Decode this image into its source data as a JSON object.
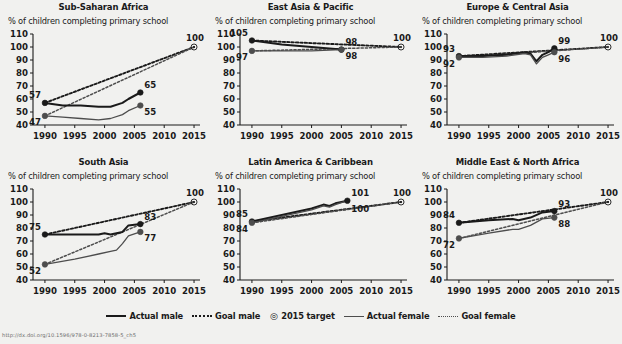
{
  "figure": {
    "subtitle_text": "% of children completing primary school",
    "footer": "http://dx.doi.org/10.1596/978-0-8213-7858-5_ch5"
  },
  "axis": {
    "y_ticks": [
      40,
      50,
      60,
      70,
      80,
      90,
      100,
      110
    ],
    "x_ticks": [
      1990,
      1995,
      2000,
      2005,
      2010,
      2015
    ],
    "ylim": [
      40,
      110
    ],
    "xlim": [
      1988,
      2016
    ],
    "grid": false
  },
  "legend": {
    "position": "bottom-center",
    "items": [
      {
        "label": "Actual male",
        "marker": "solid-line-thick"
      },
      {
        "label": "Goal male",
        "marker": "dotted-line-thick"
      },
      {
        "label": "2015 target",
        "marker": "circle-dot-target"
      },
      {
        "label": "Actual female",
        "marker": "solid-line-thin"
      },
      {
        "label": "Goal female",
        "marker": "dotted-line-thin"
      }
    ]
  },
  "colors": {
    "background": "#f1f1ef",
    "male": "#1a1a1a",
    "female": "#4d4d4d",
    "axis": "#1a1a1a",
    "text": "#1a1a1a"
  },
  "chart_data": [
    {
      "type": "line",
      "title": "Sub-Saharan Africa",
      "xlabel": "",
      "ylabel": "% of children completing primary school",
      "ylim": [
        40,
        110
      ],
      "xlim": [
        1988,
        2016
      ],
      "target": {
        "year": 2015,
        "value": 100,
        "label": "100"
      },
      "series": [
        {
          "name": "Actual male",
          "style": "solid-thick",
          "x": [
            1990,
            1993,
            1996,
            1999,
            2001,
            2003,
            2004,
            2006
          ],
          "values": [
            57,
            55,
            55,
            54,
            54,
            57,
            60,
            65
          ],
          "endpoints": [
            {
              "year": 1990,
              "value": 57,
              "label": "57"
            },
            {
              "year": 2006,
              "value": 65,
              "label": "65"
            }
          ]
        },
        {
          "name": "Actual female",
          "style": "solid-thin",
          "x": [
            1990,
            1993,
            1996,
            1999,
            2001,
            2003,
            2004,
            2006
          ],
          "values": [
            47,
            46,
            45,
            44,
            45,
            48,
            51,
            55
          ],
          "endpoints": [
            {
              "year": 1990,
              "value": 47,
              "label": "47"
            },
            {
              "year": 2006,
              "value": 55,
              "label": "55"
            }
          ]
        },
        {
          "name": "Goal male",
          "style": "dotted-thick",
          "x": [
            1990,
            2015
          ],
          "values": [
            57,
            100
          ]
        },
        {
          "name": "Goal female",
          "style": "dotted-thin",
          "x": [
            1990,
            2015
          ],
          "values": [
            47,
            100
          ]
        }
      ]
    },
    {
      "type": "line",
      "title": "East Asia & Pacific",
      "xlabel": "",
      "ylabel": "% of children completing primary school",
      "ylim": [
        40,
        110
      ],
      "xlim": [
        1988,
        2016
      ],
      "target": {
        "year": 2015,
        "value": 100,
        "label": "100"
      },
      "series": [
        {
          "name": "Actual male",
          "style": "solid-thick",
          "x": [
            1990,
            1995,
            2000,
            2005
          ],
          "values": [
            105,
            102,
            100,
            98
          ],
          "endpoints": [
            {
              "year": 1990,
              "value": 105,
              "label": "105"
            },
            {
              "year": 2005,
              "value": 98,
              "label": "98"
            }
          ]
        },
        {
          "name": "Actual female",
          "style": "solid-thin",
          "x": [
            1990,
            1995,
            2000,
            2005
          ],
          "values": [
            97,
            97,
            97,
            98
          ],
          "endpoints": [
            {
              "year": 1990,
              "value": 97,
              "label": "97"
            },
            {
              "year": 2005,
              "value": 98,
              "label": "98"
            }
          ]
        },
        {
          "name": "Goal male",
          "style": "dotted-thick",
          "x": [
            1990,
            2015
          ],
          "values": [
            105,
            100
          ]
        },
        {
          "name": "Goal female",
          "style": "dotted-thin",
          "x": [
            1990,
            2015
          ],
          "values": [
            97,
            100
          ]
        }
      ]
    },
    {
      "type": "line",
      "title": "Europe & Central Asia",
      "xlabel": "",
      "ylabel": "% of children completing primary school",
      "ylim": [
        40,
        110
      ],
      "xlim": [
        1988,
        2016
      ],
      "target": {
        "year": 2015,
        "value": 100,
        "label": "100"
      },
      "series": [
        {
          "name": "Actual male",
          "style": "solid-thick",
          "x": [
            1990,
            1994,
            1998,
            2001,
            2002,
            2003,
            2004,
            2005,
            2006
          ],
          "values": [
            93,
            93,
            94,
            96,
            95,
            89,
            94,
            96,
            99
          ],
          "endpoints": [
            {
              "year": 1990,
              "value": 93,
              "label": "93"
            },
            {
              "year": 2006,
              "value": 99,
              "label": "99"
            }
          ]
        },
        {
          "name": "Actual female",
          "style": "solid-thin",
          "x": [
            1990,
            1994,
            1998,
            2001,
            2002,
            2003,
            2004,
            2005,
            2006
          ],
          "values": [
            92,
            92,
            93,
            95,
            94,
            87,
            92,
            94,
            96
          ],
          "endpoints": [
            {
              "year": 1990,
              "value": 92,
              "label": "92"
            },
            {
              "year": 2006,
              "value": 96,
              "label": "96"
            }
          ]
        },
        {
          "name": "Goal male",
          "style": "dotted-thick",
          "x": [
            1990,
            2015
          ],
          "values": [
            93,
            100
          ]
        },
        {
          "name": "Goal female",
          "style": "dotted-thin",
          "x": [
            1990,
            2015
          ],
          "values": [
            92,
            100
          ]
        }
      ]
    },
    {
      "type": "line",
      "title": "South Asia",
      "xlabel": "",
      "ylabel": "% of children completing primary school",
      "ylim": [
        40,
        110
      ],
      "xlim": [
        1988,
        2016
      ],
      "target": {
        "year": 2015,
        "value": 100,
        "label": "100"
      },
      "series": [
        {
          "name": "Actual male",
          "style": "solid-thick",
          "x": [
            1990,
            1995,
            1999,
            2000,
            2001,
            2003,
            2004,
            2006
          ],
          "values": [
            75,
            75,
            75,
            76,
            75,
            77,
            82,
            83
          ],
          "endpoints": [
            {
              "year": 1990,
              "value": 75,
              "label": "75"
            },
            {
              "year": 2006,
              "value": 83,
              "label": "83"
            }
          ]
        },
        {
          "name": "Actual female",
          "style": "solid-thin",
          "x": [
            1990,
            1995,
            1999,
            2001,
            2002,
            2003,
            2004,
            2006
          ],
          "values": [
            52,
            56,
            60,
            62,
            63,
            68,
            74,
            77
          ],
          "endpoints": [
            {
              "year": 1990,
              "value": 52,
              "label": "52"
            },
            {
              "year": 2006,
              "value": 77,
              "label": "77"
            }
          ]
        },
        {
          "name": "Goal male",
          "style": "dotted-thick",
          "x": [
            1990,
            2015
          ],
          "values": [
            75,
            100
          ]
        },
        {
          "name": "Goal female",
          "style": "dotted-thin",
          "x": [
            1990,
            2015
          ],
          "values": [
            52,
            100
          ]
        }
      ]
    },
    {
      "type": "line",
      "title": "Latin America & Caribbean",
      "xlabel": "",
      "ylabel": "% of children completing primary school",
      "ylim": [
        40,
        110
      ],
      "xlim": [
        1988,
        2016
      ],
      "target": {
        "year": 2015,
        "value": 100,
        "label": "100"
      },
      "series": [
        {
          "name": "Actual male",
          "style": "solid-thick",
          "x": [
            1990,
            1995,
            2000,
            2002,
            2003,
            2004,
            2006
          ],
          "values": [
            85,
            90,
            95,
            98,
            97,
            99,
            101
          ],
          "endpoints": [
            {
              "year": 1990,
              "value": 85,
              "label": "85"
            },
            {
              "year": 2006,
              "value": 101,
              "label": "101"
            }
          ]
        },
        {
          "name": "Actual female",
          "style": "solid-thin",
          "x": [
            1990,
            1995,
            2000,
            2002,
            2003,
            2004,
            2006
          ],
          "values": [
            84,
            89,
            94,
            97,
            96,
            98,
            101
          ],
          "endpoints": [
            {
              "year": 1990,
              "value": 84,
              "label": "84"
            }
          ]
        },
        {
          "name": "Goal male",
          "style": "dotted-thick",
          "x": [
            1990,
            2015
          ],
          "values": [
            85,
            100
          ]
        },
        {
          "name": "Goal female",
          "style": "dotted-thin",
          "x": [
            1990,
            2015
          ],
          "values": [
            84,
            100
          ],
          "endpoints": [
            {
              "year": 2006,
              "value": 100,
              "label": "100"
            }
          ]
        }
      ]
    },
    {
      "type": "line",
      "title": "Middle East & North Africa",
      "xlabel": "",
      "ylabel": "% of children completing primary school",
      "ylim": [
        40,
        110
      ],
      "xlim": [
        1988,
        2016
      ],
      "target": {
        "year": 2015,
        "value": 100,
        "label": "100"
      },
      "series": [
        {
          "name": "Actual male",
          "style": "solid-thick",
          "x": [
            1990,
            1995,
            1999,
            2000,
            2002,
            2004,
            2006
          ],
          "values": [
            84,
            86,
            87,
            86,
            88,
            92,
            93
          ],
          "endpoints": [
            {
              "year": 1990,
              "value": 84,
              "label": "84"
            },
            {
              "year": 2006,
              "value": 93,
              "label": "93"
            }
          ]
        },
        {
          "name": "Actual female",
          "style": "solid-thin",
          "x": [
            1990,
            1995,
            1999,
            2000,
            2002,
            2004,
            2006
          ],
          "values": [
            72,
            76,
            79,
            79,
            82,
            87,
            88
          ],
          "endpoints": [
            {
              "year": 1990,
              "value": 72,
              "label": "72"
            },
            {
              "year": 2006,
              "value": 88,
              "label": "88"
            }
          ]
        },
        {
          "name": "Goal male",
          "style": "dotted-thick",
          "x": [
            1990,
            2015
          ],
          "values": [
            84,
            100
          ]
        },
        {
          "name": "Goal female",
          "style": "dotted-thin",
          "x": [
            1990,
            2015
          ],
          "values": [
            72,
            100
          ]
        }
      ]
    }
  ]
}
